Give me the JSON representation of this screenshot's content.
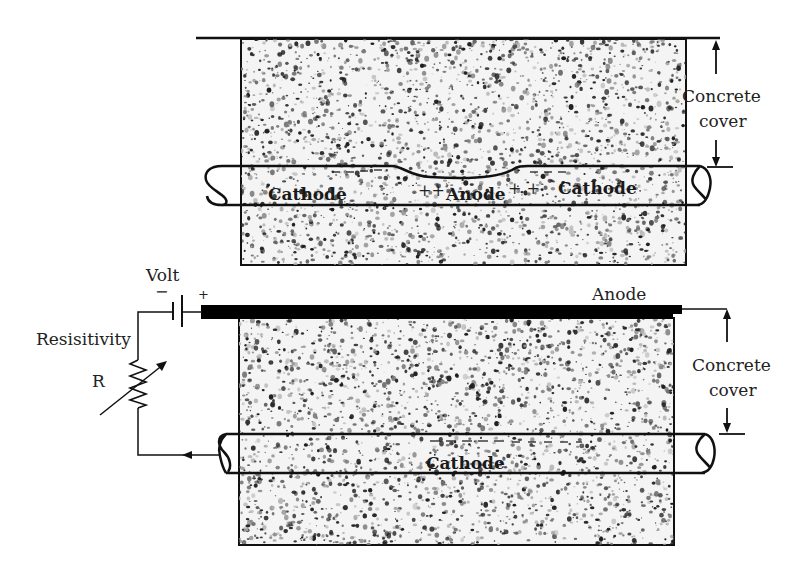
{
  "figure": {
    "type": "diagram"
  },
  "top_panel": {
    "labels": {
      "cathode_left": "Cathode",
      "anode": "Anode",
      "anode_plus_left": "++",
      "anode_plus_right": "+ +",
      "cathode_right": "Cathode",
      "cover_line1": "Concrete",
      "cover_line2": "cover"
    },
    "minus_marks": "− − −"
  },
  "bottom_panel": {
    "labels": {
      "volt": "Volt",
      "minus": "−",
      "plus": "+",
      "resistivity": "Resisitivity",
      "resistor": "R",
      "anode": "Anode",
      "cathode": "Cathode",
      "cover_line1": "Concrete",
      "cover_line2": "cover"
    }
  },
  "colors": {
    "line": "#111111",
    "concrete_base": "#f4f4f4",
    "aggregate_dark": "#1e1e1e",
    "aggregate_mid": "#7a7a7a",
    "anode_bar": "#000000"
  }
}
